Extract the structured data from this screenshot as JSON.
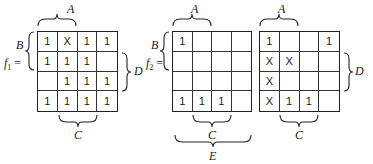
{
  "maps": [
    {
      "id": "f1",
      "function_label": "f",
      "function_subscript": "1",
      "equals": "=",
      "labels": {
        "A": "A",
        "B": "B",
        "C": "C",
        "D": "D"
      },
      "cells": [
        [
          "1",
          "X",
          "1",
          "1"
        ],
        [
          "1",
          "1",
          "1",
          ""
        ],
        [
          "",
          "1",
          "1",
          "1"
        ],
        [
          "1",
          "1",
          "1",
          "1"
        ]
      ]
    },
    {
      "id": "f2-left",
      "function_label": "f",
      "function_subscript": "2",
      "equals": "=",
      "labels": {
        "A": "A",
        "B": "B",
        "C": "C",
        "E": "E"
      },
      "cells": [
        [
          "1",
          "",
          "",
          ""
        ],
        [
          "",
          "",
          "",
          ""
        ],
        [
          "",
          "",
          "",
          ""
        ],
        [
          "1",
          "1",
          "1",
          ""
        ]
      ]
    },
    {
      "id": "f2-right",
      "labels": {
        "A": "A",
        "C": "C",
        "D": "D"
      },
      "cells": [
        [
          "1",
          "",
          "",
          "1"
        ],
        [
          "X",
          "X",
          "",
          ""
        ],
        [
          "X",
          "",
          "",
          ""
        ],
        [
          "X",
          "1",
          "1",
          ""
        ]
      ]
    }
  ]
}
